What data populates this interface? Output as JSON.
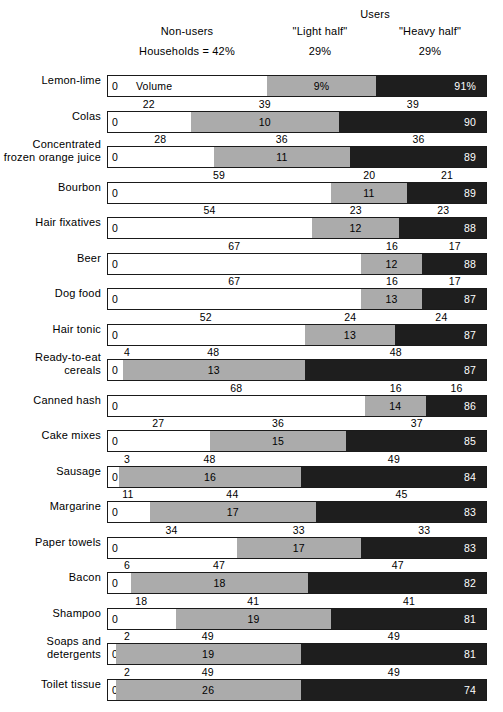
{
  "header": {
    "users_title": "Users",
    "nonusers_label": "Non-users",
    "light_half_label": "\"Light half\"",
    "heavy_half_label": "\"Heavy half\"",
    "households_pct": "Households = 42%",
    "light_pct": "29%",
    "heavy_pct": "29%",
    "volume_word": "Volume"
  },
  "colors": {
    "nonusers": "#ffffff",
    "light_half": "#ababab",
    "heavy_half": "#1e1e1e",
    "outline": "#1a1a1a",
    "text": "#000000"
  },
  "chart_data": {
    "type": "bar",
    "title": "",
    "subtitle": "",
    "orientation": "horizontal",
    "stacked": true,
    "xlabel": "",
    "ylabel": "",
    "xlim": [
      0,
      100
    ],
    "grid": false,
    "legend_position": "top",
    "legend": [
      "Non-users",
      "\"Light half\"",
      "\"Heavy half\""
    ],
    "series": [
      {
        "name": "Non-users",
        "label": "Non-users"
      },
      {
        "name": "Light half",
        "label": "\"Light half\""
      },
      {
        "name": "Heavy half",
        "label": "\"Heavy half\""
      }
    ],
    "categories": [
      "Lemon-lime",
      "Colas",
      "Concentrated frozen orange juice",
      "Bourbon",
      "Hair fixatives",
      "Beer",
      "Dog food",
      "Hair tonic",
      "Ready-to-eat cereals",
      "Canned hash",
      "Cake mixes",
      "Sausage",
      "Margarine",
      "Paper towels",
      "Bacon",
      "Shampoo",
      "Soaps and detergents",
      "Toilet tissue"
    ],
    "rows": [
      {
        "product": "Lemon-lime",
        "label_lines": [
          "Lemon-lime"
        ],
        "households": [
          42,
          29,
          29
        ],
        "households_text": [
          "Households = 42%",
          "29%",
          "29%"
        ],
        "volume": [
          0,
          9,
          91
        ],
        "volume_text": [
          "0",
          "9%",
          "91%"
        ],
        "note": "Volume"
      },
      {
        "product": "Colas",
        "label_lines": [
          "Colas"
        ],
        "households": [
          22,
          39,
          39
        ],
        "households_text": [
          "22",
          "39",
          "39"
        ],
        "volume": [
          0,
          10,
          90
        ],
        "volume_text": [
          "0",
          "10",
          "90"
        ]
      },
      {
        "product": "Concentrated frozen orange juice",
        "label_lines": [
          "Concentrated",
          "frozen orange juice"
        ],
        "households": [
          28,
          36,
          36
        ],
        "households_text": [
          "28",
          "36",
          "36"
        ],
        "volume": [
          0,
          11,
          89
        ],
        "volume_text": [
          "0",
          "11",
          "89"
        ]
      },
      {
        "product": "Bourbon",
        "label_lines": [
          "Bourbon"
        ],
        "households": [
          59,
          20,
          21
        ],
        "households_text": [
          "59",
          "20",
          "21"
        ],
        "volume": [
          0,
          11,
          89
        ],
        "volume_text": [
          "0",
          "11",
          "89"
        ]
      },
      {
        "product": "Hair fixatives",
        "label_lines": [
          "Hair fixatives"
        ],
        "households": [
          54,
          23,
          23
        ],
        "households_text": [
          "54",
          "23",
          "23"
        ],
        "volume": [
          0,
          12,
          88
        ],
        "volume_text": [
          "0",
          "12",
          "88"
        ]
      },
      {
        "product": "Beer",
        "label_lines": [
          "Beer"
        ],
        "households": [
          67,
          16,
          17
        ],
        "households_text": [
          "67",
          "16",
          "17"
        ],
        "volume": [
          0,
          12,
          88
        ],
        "volume_text": [
          "0",
          "12",
          "88"
        ]
      },
      {
        "product": "Dog food",
        "label_lines": [
          "Dog food"
        ],
        "households": [
          67,
          16,
          17
        ],
        "households_text": [
          "67",
          "16",
          "17"
        ],
        "volume": [
          0,
          13,
          87
        ],
        "volume_text": [
          "0",
          "13",
          "87"
        ]
      },
      {
        "product": "Hair tonic",
        "label_lines": [
          "Hair tonic"
        ],
        "households": [
          52,
          24,
          24
        ],
        "households_text": [
          "52",
          "24",
          "24"
        ],
        "volume": [
          0,
          13,
          87
        ],
        "volume_text": [
          "0",
          "13",
          "87"
        ]
      },
      {
        "product": "Ready-to-eat cereals",
        "label_lines": [
          "Ready-to-eat",
          "cereals"
        ],
        "households": [
          4,
          48,
          48
        ],
        "households_text": [
          "4",
          "48",
          "48"
        ],
        "volume": [
          0,
          13,
          87
        ],
        "volume_text": [
          "0",
          "13",
          "87"
        ]
      },
      {
        "product": "Canned hash",
        "label_lines": [
          "Canned hash"
        ],
        "households": [
          68,
          16,
          16
        ],
        "households_text": [
          "68",
          "16",
          "16"
        ],
        "volume": [
          0,
          14,
          86
        ],
        "volume_text": [
          "0",
          "14",
          "86"
        ]
      },
      {
        "product": "Cake mixes",
        "label_lines": [
          "Cake mixes"
        ],
        "households": [
          27,
          36,
          37
        ],
        "households_text": [
          "27",
          "36",
          "37"
        ],
        "volume": [
          0,
          15,
          85
        ],
        "volume_text": [
          "0",
          "15",
          "85"
        ]
      },
      {
        "product": "Sausage",
        "label_lines": [
          "Sausage"
        ],
        "households": [
          3,
          48,
          49
        ],
        "households_text": [
          "3",
          "48",
          "49"
        ],
        "volume": [
          0,
          16,
          84
        ],
        "volume_text": [
          "0",
          "16",
          "84"
        ]
      },
      {
        "product": "Margarine",
        "label_lines": [
          "Margarine"
        ],
        "households": [
          11,
          44,
          45
        ],
        "households_text": [
          "11",
          "44",
          "45"
        ],
        "volume": [
          0,
          17,
          83
        ],
        "volume_text": [
          "0",
          "17",
          "83"
        ]
      },
      {
        "product": "Paper towels",
        "label_lines": [
          "Paper towels"
        ],
        "households": [
          34,
          33,
          33
        ],
        "households_text": [
          "34",
          "33",
          "33"
        ],
        "volume": [
          0,
          17,
          83
        ],
        "volume_text": [
          "0",
          "17",
          "83"
        ]
      },
      {
        "product": "Bacon",
        "label_lines": [
          "Bacon"
        ],
        "households": [
          6,
          47,
          47
        ],
        "households_text": [
          "6",
          "47",
          "47"
        ],
        "volume": [
          0,
          18,
          82
        ],
        "volume_text": [
          "0",
          "18",
          "82"
        ]
      },
      {
        "product": "Shampoo",
        "label_lines": [
          "Shampoo"
        ],
        "households": [
          18,
          41,
          41
        ],
        "households_text": [
          "18",
          "41",
          "41"
        ],
        "volume": [
          0,
          19,
          81
        ],
        "volume_text": [
          "0",
          "19",
          "81"
        ]
      },
      {
        "product": "Soaps and detergents",
        "label_lines": [
          "Soaps and",
          "detergents"
        ],
        "households": [
          2,
          49,
          49
        ],
        "households_text": [
          "2",
          "49",
          "49"
        ],
        "volume": [
          0,
          19,
          81
        ],
        "volume_text": [
          "0",
          "19",
          "81"
        ]
      },
      {
        "product": "Toilet tissue",
        "label_lines": [
          "Toilet tissue"
        ],
        "households": [
          2,
          49,
          49
        ],
        "households_text": [
          "2",
          "49",
          "49"
        ],
        "volume": [
          0,
          26,
          74
        ],
        "volume_text": [
          "0",
          "26",
          "74"
        ]
      }
    ]
  }
}
